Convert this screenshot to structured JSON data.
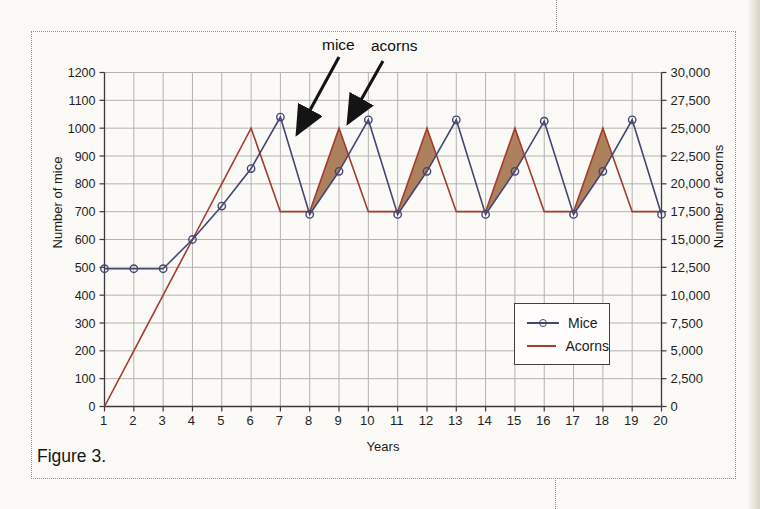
{
  "page": {
    "figure_caption": "Figure 3.",
    "background": "#fbfaf7",
    "frame_border_color": "#8c8c8c"
  },
  "annotations": {
    "mice_label": "mice",
    "acorns_label": "acorns",
    "arrow_color": "#141414"
  },
  "legend": {
    "border_color": "#3f3f3f",
    "items": [
      {
        "label": "Mice",
        "color": "#434672",
        "marker": "circle"
      },
      {
        "label": "Acorns",
        "color": "#a53b2b",
        "marker": "line"
      }
    ]
  },
  "chart_data": {
    "type": "line",
    "title": "",
    "xlabel": "Years",
    "ylabel_left": "Number of mice",
    "ylabel_right": "Number of acorns",
    "grid": true,
    "legend_position": "inside-lower-right",
    "x": [
      1,
      2,
      3,
      4,
      5,
      6,
      7,
      8,
      9,
      10,
      11,
      12,
      13,
      14,
      15,
      16,
      17,
      18,
      19,
      20
    ],
    "x_tick_labels": [
      "1",
      "2",
      "3",
      "4",
      "5",
      "6",
      "7",
      "8",
      "9",
      "10",
      "11",
      "12",
      "13",
      "14",
      "15",
      "16",
      "17",
      "18",
      "19",
      "20"
    ],
    "left_axis": {
      "min": 0,
      "max": 1200,
      "step": 100,
      "tick_labels": [
        "0",
        "100",
        "200",
        "300",
        "400",
        "500",
        "600",
        "700",
        "800",
        "900",
        "1000",
        "1100",
        "1200"
      ]
    },
    "right_axis": {
      "min": 0,
      "max": 30000,
      "step": 2500,
      "tick_labels": [
        "0",
        "2,500",
        "5,000",
        "7,500",
        "10,000",
        "12,500",
        "15,000",
        "17,500",
        "20,000",
        "22,500",
        "25,000",
        "27,500",
        "30,000"
      ]
    },
    "series": [
      {
        "name": "Mice",
        "axis": "left",
        "color": "#434672",
        "marker": "circle",
        "values": [
          495,
          495,
          495,
          600,
          720,
          855,
          1040,
          690,
          845,
          1030,
          690,
          845,
          1030,
          690,
          845,
          1025,
          690,
          845,
          1030,
          690
        ]
      },
      {
        "name": "Acorns",
        "axis": "right",
        "color": "#a53b2b",
        "marker": "none",
        "values": [
          0,
          5000,
          10000,
          15000,
          20000,
          25000,
          17500,
          17500,
          25000,
          17500,
          17500,
          25000,
          17500,
          17500,
          25000,
          17500,
          17500,
          25000,
          17500,
          17500
        ]
      }
    ],
    "shaded_regions": {
      "color": "#aa7a55",
      "opacity": 0.95,
      "start_years": [
        8,
        11,
        14,
        17
      ]
    }
  }
}
